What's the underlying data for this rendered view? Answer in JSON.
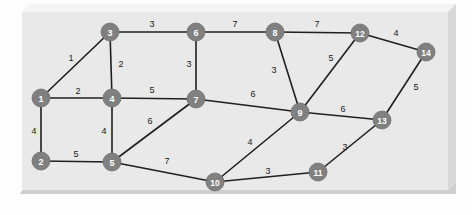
{
  "figure": {
    "panel": {
      "x": 22,
      "y": 12,
      "width": 426,
      "height": 178,
      "fill": "#e9e9e9",
      "bevel_top": "#f4f4f4",
      "bevel_side": "#d8d8d8",
      "bevel_bottom": "#cfcfcf",
      "outer_background": "#fdfdfd"
    },
    "style": {
      "node_fill": "#808080",
      "node_stroke": "#6e6e6e",
      "node_radius": 9,
      "node_label_color": "#ffffff",
      "node_label_size": 9,
      "edge_color": "#1f1f1f",
      "edge_width": 1.6,
      "weight_color": "#1a1a1a",
      "weight_size": 9
    }
  },
  "chart_data": {
    "type": "diagram",
    "subtype": "weighted-undirected-graph",
    "title": "",
    "node_count": 14,
    "edge_count": 22,
    "nodes": [
      {
        "id": "1",
        "label": "1",
        "x": 41,
        "y": 98
      },
      {
        "id": "2",
        "label": "2",
        "x": 41,
        "y": 161
      },
      {
        "id": "3",
        "label": "3",
        "x": 110,
        "y": 32
      },
      {
        "id": "4",
        "label": "4",
        "x": 112,
        "y": 98
      },
      {
        "id": "5",
        "label": "5",
        "x": 112,
        "y": 162
      },
      {
        "id": "6",
        "label": "6",
        "x": 196,
        "y": 32
      },
      {
        "id": "7",
        "label": "7",
        "x": 196,
        "y": 99
      },
      {
        "id": "8",
        "label": "8",
        "x": 275,
        "y": 32
      },
      {
        "id": "9",
        "label": "9",
        "x": 300,
        "y": 112
      },
      {
        "id": "10",
        "label": "10",
        "x": 215,
        "y": 182
      },
      {
        "id": "11",
        "label": "11",
        "x": 318,
        "y": 172
      },
      {
        "id": "12",
        "label": "12",
        "x": 360,
        "y": 33
      },
      {
        "id": "13",
        "label": "13",
        "x": 382,
        "y": 120
      },
      {
        "id": "14",
        "label": "14",
        "x": 426,
        "y": 52
      }
    ],
    "edges": [
      {
        "source": "1",
        "target": "3",
        "weight": 1,
        "label_x": 71,
        "label_y": 59
      },
      {
        "source": "1",
        "target": "4",
        "weight": 2,
        "label_x": 78,
        "label_y": 92
      },
      {
        "source": "1",
        "target": "2",
        "weight": 4,
        "label_x": 34,
        "label_y": 132
      },
      {
        "source": "2",
        "target": "5",
        "weight": 5,
        "label_x": 76,
        "label_y": 155
      },
      {
        "source": "3",
        "target": "4",
        "weight": 2,
        "label_x": 121,
        "label_y": 65
      },
      {
        "source": "3",
        "target": "6",
        "weight": 3,
        "label_x": 152,
        "label_y": 25
      },
      {
        "source": "4",
        "target": "5",
        "weight": 4,
        "label_x": 104,
        "label_y": 132
      },
      {
        "source": "4",
        "target": "7",
        "weight": 5,
        "label_x": 152,
        "label_y": 91
      },
      {
        "source": "5",
        "target": "7",
        "weight": 6,
        "label_x": 150,
        "label_y": 122
      },
      {
        "source": "5",
        "target": "10",
        "weight": 7,
        "label_x": 167,
        "label_y": 162
      },
      {
        "source": "6",
        "target": "7",
        "weight": 3,
        "label_x": 189,
        "label_y": 65
      },
      {
        "source": "6",
        "target": "8",
        "weight": 7,
        "label_x": 235,
        "label_y": 25
      },
      {
        "source": "7",
        "target": "9",
        "weight": 6,
        "label_x": 253,
        "label_y": 95
      },
      {
        "source": "8",
        "target": "9",
        "weight": 3,
        "label_x": 274,
        "label_y": 71
      },
      {
        "source": "8",
        "target": "12",
        "weight": 7,
        "label_x": 317,
        "label_y": 25
      },
      {
        "source": "9",
        "target": "10",
        "weight": 4,
        "label_x": 250,
        "label_y": 143
      },
      {
        "source": "9",
        "target": "12",
        "weight": 5,
        "label_x": 331,
        "label_y": 59
      },
      {
        "source": "9",
        "target": "13",
        "weight": 6,
        "label_x": 343,
        "label_y": 110
      },
      {
        "source": "10",
        "target": "11",
        "weight": 3,
        "label_x": 268,
        "label_y": 172
      },
      {
        "source": "11",
        "target": "13",
        "weight": 3,
        "label_x": 345,
        "label_y": 148
      },
      {
        "source": "12",
        "target": "14",
        "weight": 4,
        "label_x": 396,
        "label_y": 34
      },
      {
        "source": "13",
        "target": "14",
        "weight": 5,
        "label_x": 416,
        "label_y": 88
      }
    ]
  }
}
